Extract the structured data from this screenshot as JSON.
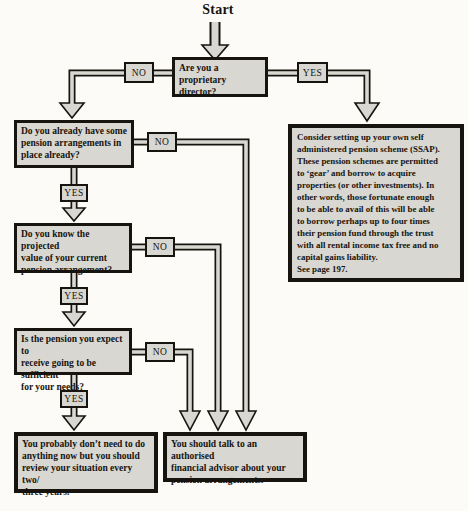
{
  "diagram": {
    "start_label": "Start",
    "yes_label": "YES",
    "no_label": "NO",
    "nodes": {
      "q_proprietary_director": "Are you a proprietary\ndirector?",
      "q_existing_arrangements": "Do you already have some\npension arrangements in\nplace already?",
      "q_projected_value": "Do you know the projected\nvalue of your current\npension arrangement?",
      "q_sufficient_pension": "Is the pension you expect to\nreceive going to be sufficient\nfor your needs?",
      "outcome_review": "You probably don’t need to do\nanything now but you should\nreview your situation every two/\nthree years.",
      "outcome_advisor": "You should talk to an authorised\nfinancial advisor about your\npension arrangements.",
      "outcome_ssap": "Consider setting up your own self\nadministered pension scheme (SSAP).\nThese pension schemes are permitted\nto ‘gear’ and borrow to acquire\nproperties (or other investments). In\nother words, those fortunate enough\nto be able to avail of this will be able\nto borrow perhaps up to four times\ntheir pension fund through the trust\nwith all rental income tax free and no\ncapital gains liability.\nSee page 197."
    },
    "colors": {
      "background": "#fcfbf7",
      "box_fill": "#d9d7d1",
      "box_border": "#17140f",
      "pipe_fill": "#d9d7d1",
      "pipe_outline": "#17140f"
    }
  }
}
